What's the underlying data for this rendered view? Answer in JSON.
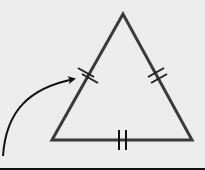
{
  "diagram": {
    "type": "isosceles-equilateral-triangle",
    "colors": {
      "background": "#ececec",
      "stroke": "#3a3a3a",
      "arrow": "#111111"
    },
    "vertices": {
      "apex": [
        123,
        14
      ],
      "bottom_left": [
        52,
        140
      ],
      "bottom_right": [
        192,
        140
      ]
    },
    "tick_marks": [
      {
        "side": "left",
        "count": 2,
        "center": [
          88,
          75
        ]
      },
      {
        "side": "right",
        "count": 2,
        "center": [
          158,
          75
        ]
      },
      {
        "side": "base",
        "count": 2,
        "center": [
          123,
          140
        ]
      }
    ],
    "arrow": {
      "from": [
        3,
        155
      ],
      "to": [
        75,
        78
      ],
      "points_to": "left-side-tick-marks"
    }
  }
}
